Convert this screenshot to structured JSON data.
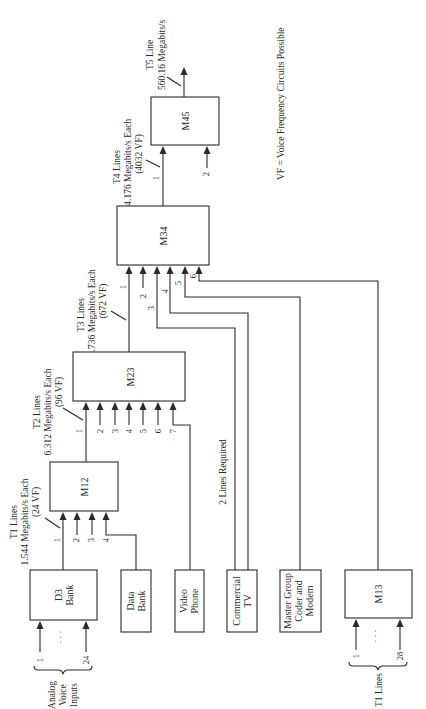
{
  "diagram": {
    "orientation": "rotated-90-ccw",
    "blocks": {
      "m45": {
        "label": "M45"
      },
      "m34": {
        "label": "M34"
      },
      "m23": {
        "label": "M23"
      },
      "m12": {
        "label": "M12"
      },
      "d3_bank": {
        "line1": "D3",
        "line2": "Bank"
      },
      "data_bank": {
        "line1": "Data",
        "line2": "Bank"
      },
      "video_phone": {
        "line1": "Video",
        "line2": "Phone"
      },
      "commercial_tv": {
        "line1": "Commercial",
        "line2": "TV"
      },
      "master_group": {
        "line1": "Master Group",
        "line2": "Coder and",
        "line3": "Modem"
      },
      "m13": {
        "label": "M13"
      }
    },
    "annotations": {
      "t5": {
        "line1": "T5 Line",
        "line2": "560.16 Megabits/s"
      },
      "t4": {
        "line1": "T4 Lines",
        "line2": "274.176 Megabits/s Each",
        "line3": "(4032 VF)"
      },
      "t3": {
        "line1": "T3 Lines",
        "line2": "44.736 Megabits/s Each",
        "line3": "(672 VF)"
      },
      "t2": {
        "line1": "T2 Lines",
        "line2": "6.312 Megabits/s Each",
        "line3": "(96 VF)"
      },
      "t1": {
        "line1": "T1 Lines",
        "line2": "1.544 Megabits/s Each",
        "line3": "(24 VF)"
      },
      "legend": "VF = Voice Frequency Circuits Possible",
      "two_lines": "2 Lines Required",
      "analog": {
        "line1": "Analog",
        "line2": "Voice",
        "line3": "Inputs"
      },
      "t1_lines_bottom": "T1 Lines"
    },
    "input_numbers": {
      "m45": [
        "1",
        "2"
      ],
      "m34": [
        "1",
        "2",
        "3",
        "4",
        "5",
        "6"
      ],
      "m23": [
        "1",
        "2",
        "3",
        "4",
        "5",
        "6",
        "7"
      ],
      "m12": [
        "1",
        "2",
        "3",
        "4"
      ],
      "d3": [
        "1",
        "24"
      ],
      "m13": [
        "1",
        "28"
      ]
    },
    "ellipsis": "· · ·"
  }
}
